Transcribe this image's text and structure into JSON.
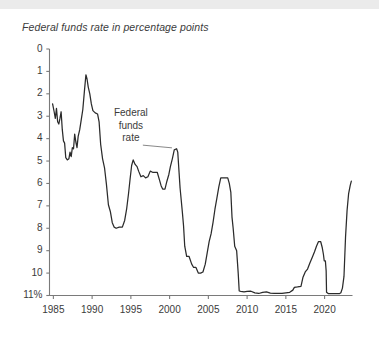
{
  "chart_title": "Federal funds rate in percentage points",
  "annotation": {
    "line1": "Federal",
    "line2": "funds",
    "line3": "rate"
  },
  "axis": {
    "y_ticks": [
      "11%",
      "10",
      "9",
      "8",
      "7",
      "6",
      "5",
      "4",
      "3",
      "2",
      "1",
      "0"
    ],
    "x_ticks": [
      "1985",
      "1990",
      "1995",
      "2000",
      "2005",
      "2010",
      "2015",
      "2020"
    ]
  },
  "colors": {
    "line": "#2b2b2b",
    "axis": "#7a7a7a",
    "text": "#3b3b3b",
    "background": "#ffffff",
    "top_band": "#ebebeb"
  },
  "chart_data": {
    "type": "line",
    "title": "Federal funds rate in percentage points",
    "xlabel": "",
    "ylabel": "percentage points",
    "xlim": [
      1984.5,
      2023.6
    ],
    "ylim": [
      0,
      11
    ],
    "grid": false,
    "legend": null,
    "annotations": [
      {
        "text": "Federal funds rate",
        "x": 1995.0,
        "y": 7.2,
        "points_to_x": 2000.3,
        "points_to_y": 6.5
      }
    ],
    "y_tick_values": [
      0,
      1,
      2,
      3,
      4,
      5,
      6,
      7,
      8,
      9,
      10,
      11
    ],
    "x_tick_values": [
      1985,
      1990,
      1995,
      2000,
      2005,
      2010,
      2015,
      2020
    ],
    "series": [
      {
        "name": "Federal funds rate",
        "x": [
          1984.9,
          1985.1,
          1985.25,
          1985.4,
          1985.55,
          1985.7,
          1985.85,
          1986.0,
          1986.15,
          1986.3,
          1986.45,
          1986.6,
          1986.8,
          1987.0,
          1987.15,
          1987.3,
          1987.45,
          1987.6,
          1987.75,
          1987.9,
          1988.05,
          1988.2,
          1988.4,
          1988.6,
          1988.8,
          1989.0,
          1989.2,
          1989.35,
          1989.5,
          1989.7,
          1989.9,
          1990.1,
          1990.4,
          1990.7,
          1990.9,
          1991.1,
          1991.35,
          1991.6,
          1991.85,
          1992.1,
          1992.35,
          1992.6,
          1992.85,
          1993.1,
          1993.5,
          1993.9,
          1994.2,
          1994.45,
          1994.7,
          1994.9,
          1995.1,
          1995.3,
          1995.55,
          1995.8,
          1996.0,
          1996.3,
          1996.6,
          1996.9,
          1997.2,
          1997.5,
          1997.8,
          1998.1,
          1998.4,
          1998.7,
          1998.9,
          1999.1,
          1999.4,
          1999.65,
          1999.9,
          2000.1,
          2000.35,
          2000.6,
          2000.9,
          2001.05,
          2001.2,
          2001.35,
          2001.5,
          2001.65,
          2001.8,
          2001.95,
          2002.2,
          2002.5,
          2002.85,
          2003.1,
          2003.4,
          2003.7,
          2004.0,
          2004.3,
          2004.6,
          2004.85,
          2005.1,
          2005.35,
          2005.6,
          2005.85,
          2006.1,
          2006.35,
          2006.6,
          2006.9,
          2007.2,
          2007.5,
          2007.7,
          2007.9,
          2008.05,
          2008.2,
          2008.4,
          2008.65,
          2008.85,
          2008.98,
          2009.2,
          2009.6,
          2010.0,
          2010.5,
          2011.0,
          2011.5,
          2012.0,
          2012.5,
          2013.0,
          2013.5,
          2014.0,
          2014.5,
          2015.0,
          2015.5,
          2015.9,
          2016.1,
          2016.5,
          2016.95,
          2017.2,
          2017.5,
          2017.8,
          2018.1,
          2018.4,
          2018.7,
          2018.95,
          2019.2,
          2019.5,
          2019.7,
          2019.85,
          2019.95,
          2020.1,
          2020.2,
          2020.25,
          2020.5,
          2021.0,
          2021.5,
          2021.9,
          2022.1,
          2022.3,
          2022.5,
          2022.7,
          2022.9,
          2023.1,
          2023.3,
          2023.45
        ],
        "y": [
          8.55,
          8.2,
          7.9,
          8.35,
          7.75,
          7.65,
          7.9,
          8.2,
          7.4,
          6.9,
          6.8,
          6.15,
          6.05,
          6.1,
          6.4,
          6.2,
          6.6,
          6.55,
          7.2,
          6.85,
          6.6,
          7.1,
          7.4,
          7.85,
          8.3,
          9.1,
          9.85,
          9.65,
          9.3,
          9.0,
          8.55,
          8.25,
          8.15,
          8.1,
          7.75,
          6.75,
          6.1,
          5.7,
          4.95,
          4.05,
          3.75,
          3.25,
          3.05,
          3.0,
          3.05,
          3.05,
          3.35,
          3.85,
          4.55,
          5.2,
          5.8,
          6.05,
          5.85,
          5.75,
          5.55,
          5.3,
          5.35,
          5.25,
          5.3,
          5.55,
          5.5,
          5.5,
          5.5,
          5.15,
          4.9,
          4.75,
          4.75,
          5.1,
          5.4,
          5.75,
          6.1,
          6.5,
          6.55,
          6.4,
          5.6,
          4.8,
          4.25,
          3.7,
          3.1,
          2.2,
          1.75,
          1.75,
          1.4,
          1.25,
          1.25,
          1.0,
          1.0,
          1.05,
          1.4,
          1.9,
          2.4,
          2.75,
          3.25,
          3.85,
          4.35,
          4.85,
          5.25,
          5.25,
          5.25,
          5.25,
          5.0,
          4.6,
          3.5,
          3.0,
          2.2,
          2.0,
          1.0,
          0.2,
          0.18,
          0.16,
          0.18,
          0.19,
          0.12,
          0.09,
          0.14,
          0.16,
          0.11,
          0.09,
          0.09,
          0.09,
          0.12,
          0.14,
          0.24,
          0.36,
          0.38,
          0.41,
          0.8,
          1.05,
          1.18,
          1.45,
          1.7,
          1.95,
          2.2,
          2.4,
          2.4,
          2.13,
          1.83,
          1.55,
          1.55,
          1.1,
          0.15,
          0.08,
          0.08,
          0.08,
          0.08,
          0.12,
          0.33,
          0.85,
          2.6,
          3.8,
          4.55,
          4.9,
          5.1
        ]
      }
    ]
  }
}
